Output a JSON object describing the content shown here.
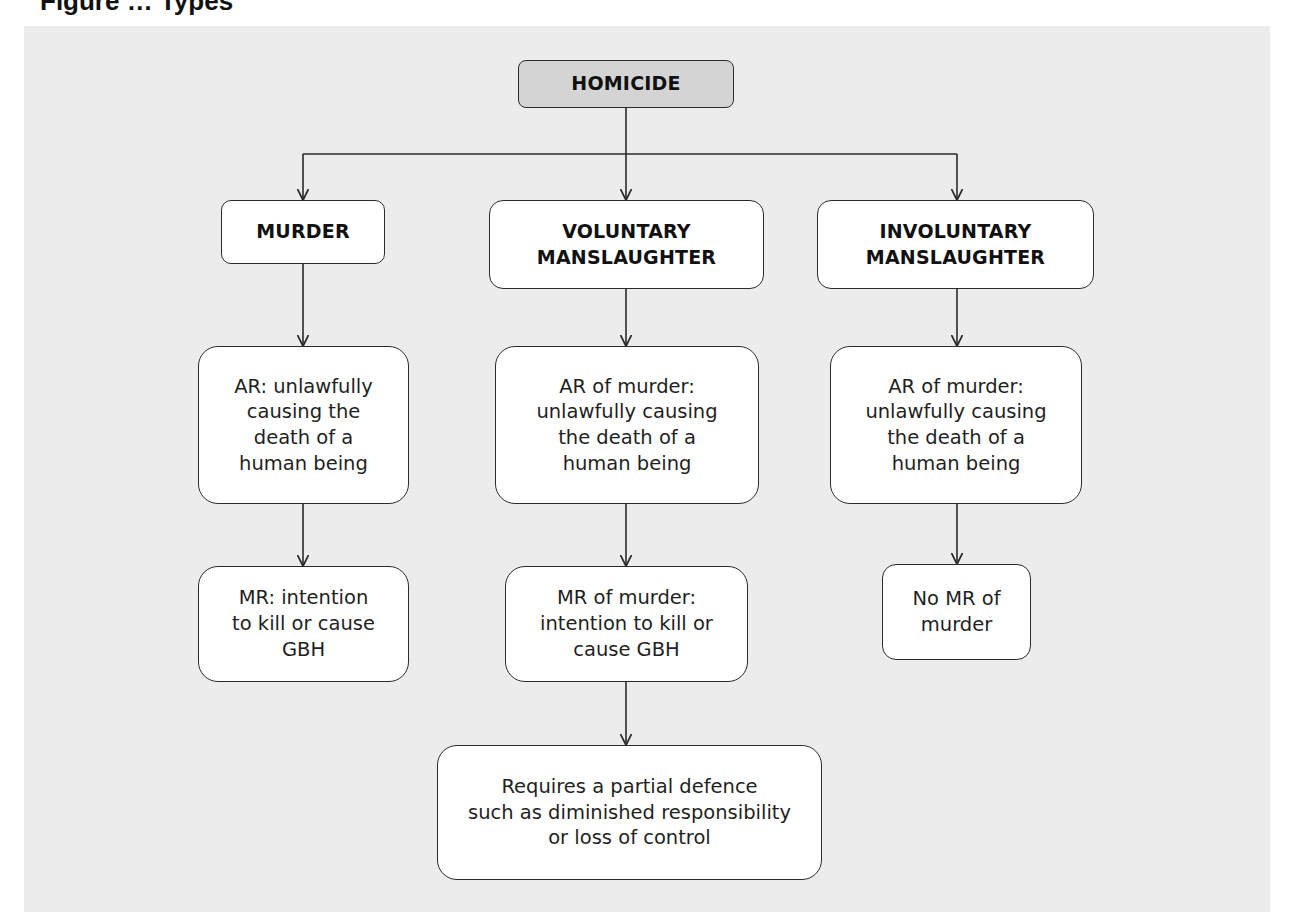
{
  "caption": {
    "partial_text": "Figure … Types"
  },
  "colors": {
    "panel_background": "#ececec",
    "page_background": "#ffffff",
    "root_fill": "#d4d4d4",
    "node_fill": "#ffffff",
    "stroke": "#2b2b2b",
    "text": "#1a1a1a"
  },
  "diagram": {
    "root": {
      "label": "HOMICIDE"
    },
    "categories": [
      {
        "label": "MURDER",
        "actus_reus": "AR: unlawfully\ncausing the\ndeath of a\nhuman being",
        "mens_rea": "MR: intention\nto kill or cause\nGBH"
      },
      {
        "label": "VOLUNTARY\nMANSLAUGHTER",
        "actus_reus": "AR of murder:\nunlawfully causing\nthe death of a\nhuman being",
        "mens_rea": "MR of murder:\nintention to kill or\ncause GBH",
        "requirement": "Requires a partial defence\nsuch as diminished responsibility\nor loss of control"
      },
      {
        "label": "INVOLUNTARY\nMANSLAUGHTER",
        "actus_reus": "AR of murder:\nunlawfully causing\nthe death of a\nhuman being",
        "mens_rea": "No MR of\nmurder"
      }
    ]
  }
}
